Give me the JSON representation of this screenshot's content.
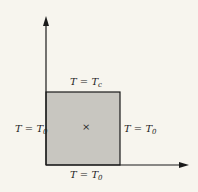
{
  "diagram": {
    "type": "boundary-condition square",
    "labels": {
      "top": {
        "lhs": "T",
        "eq": " = ",
        "var": "T",
        "sub": "c"
      },
      "left": {
        "lhs": "T",
        "eq": " = ",
        "var": "T",
        "sub": "0"
      },
      "right": {
        "lhs": "T",
        "eq": " = ",
        "var": "T",
        "sub": "0"
      },
      "bottom": {
        "lhs": "T",
        "eq": " = ",
        "var": "T",
        "sub": "0"
      }
    },
    "center_marker": "×",
    "colors": {
      "fill": "#c8c6c0",
      "stroke": "#1a1a1a",
      "background": "#f7f5ee"
    }
  }
}
